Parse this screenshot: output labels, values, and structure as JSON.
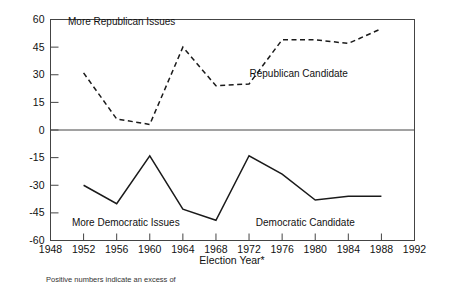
{
  "chart_data": {
    "type": "line",
    "title": "",
    "subtitle": "",
    "xlabel": "Election Year*",
    "ylabel": "",
    "xlim": [
      1948,
      1992
    ],
    "ylim": [
      -60,
      60
    ],
    "grid": false,
    "legend_position": "inline-annotations",
    "x": [
      1952,
      1956,
      1960,
      1964,
      1968,
      1972,
      1976,
      1980,
      1984,
      1988
    ],
    "xticks": [
      1948,
      1952,
      1956,
      1960,
      1964,
      1968,
      1972,
      1976,
      1980,
      1984,
      1988,
      1992
    ],
    "xticklabels": [
      "1948",
      "1952",
      "1956",
      "1960",
      "1964",
      "1968",
      "1972",
      "1976",
      "1980",
      "1984",
      "1988",
      "1992"
    ],
    "yticks": [
      60,
      45,
      30,
      15,
      0,
      -15,
      -30,
      -45,
      -60
    ],
    "yticklabels": [
      "60",
      "45",
      "30",
      "15",
      "0",
      "-15",
      "-30",
      "-45",
      "-60"
    ],
    "series": [
      {
        "name": "Republican Candidate",
        "style": "dashed",
        "color": "#1a1a1a",
        "values": [
          31,
          6,
          3,
          45,
          24,
          25,
          49,
          49,
          47,
          55
        ]
      },
      {
        "name": "Democratic Candidate",
        "style": "solid",
        "color": "#1a1a1a",
        "values": [
          -30,
          -40,
          -14,
          -43,
          -49,
          -14,
          -24,
          -38,
          -36,
          -36
        ]
      }
    ],
    "annotations": [
      {
        "name": "more-republican-issues",
        "text": "More Republican Issues",
        "x": 1956.6,
        "y": 57
      },
      {
        "name": "republican-candidate",
        "text": "Republican Candidate",
        "x": 1978.0,
        "y": 29
      },
      {
        "name": "more-democratic-issues",
        "text": "More Democratic Issues",
        "x": 1957.1,
        "y": -52
      },
      {
        "name": "democratic-candidate",
        "text": "Democratic Candidate",
        "x": 1978.8,
        "y": -52
      }
    ],
    "zero_line": 0,
    "footnote": "Positive numbers indicate an excess of"
  }
}
